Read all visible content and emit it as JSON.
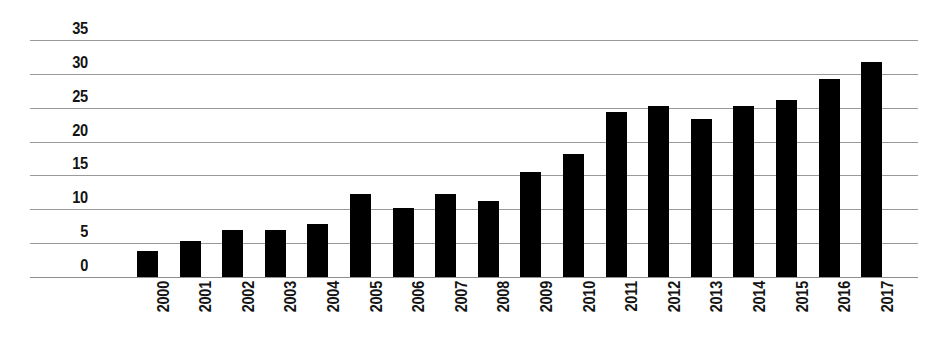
{
  "chart_data": {
    "type": "bar",
    "title": "",
    "subtitle": "",
    "xlabel": "",
    "ylabel": "",
    "categories": [
      "2000",
      "2001",
      "2002",
      "2003",
      "2004",
      "2005",
      "2006",
      "2007",
      "2008",
      "2009",
      "2010",
      "2011",
      "2012",
      "2013",
      "2014",
      "2015",
      "2016",
      "2017"
    ],
    "values": [
      3.8,
      5.3,
      7.0,
      7.0,
      7.8,
      12.2,
      10.2,
      12.2,
      11.2,
      15.5,
      18.2,
      24.4,
      25.3,
      23.3,
      25.3,
      26.2,
      29.3,
      31.8
    ],
    "ylim": [
      0,
      35
    ],
    "ytick_labels": [
      "35",
      "30",
      "25",
      "20",
      "15",
      "10",
      "5",
      "0"
    ],
    "ytick_values": [
      35,
      30,
      25,
      20,
      15,
      10,
      5,
      0
    ],
    "grid": true,
    "grid_axis": "y",
    "legend": false,
    "legend_position": "none",
    "annotations": [],
    "series": [
      {
        "name": "",
        "values": [
          3.8,
          5.3,
          7.0,
          7.0,
          7.8,
          12.2,
          10.2,
          12.2,
          11.2,
          15.5,
          18.2,
          24.4,
          25.3,
          23.3,
          25.3,
          26.2,
          29.3,
          31.8
        ]
      }
    ]
  },
  "style": {
    "background_color": "#ffffff",
    "bar_color": "#000000",
    "gridline_color": "#9a9a9a",
    "axis_line_color": "#8e8e8e",
    "tick_label_color": "#141414",
    "xtick_rotation": "90"
  }
}
